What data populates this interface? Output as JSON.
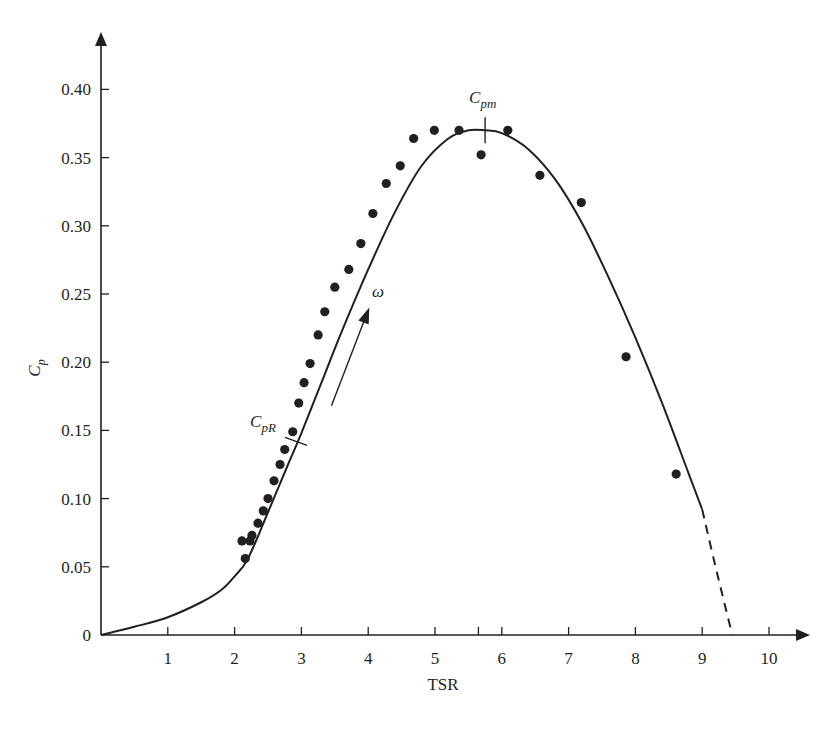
{
  "chart_data": {
    "type": "scatter",
    "title": "",
    "xlabel": "TSR",
    "ylabel": "C_p",
    "ylabel_main": "C",
    "ylabel_sub": "p",
    "xlim": [
      0,
      10.5
    ],
    "ylim": [
      0,
      0.42
    ],
    "grid": false,
    "legend": null,
    "x_ticks": [
      1,
      2,
      3,
      4,
      5,
      6,
      7,
      8,
      9,
      10
    ],
    "x_tick_labels": [
      "1",
      "2",
      "3",
      "4",
      "5",
      "6",
      "7",
      "8",
      "9",
      "10"
    ],
    "y_ticks": [
      0,
      0.05,
      0.1,
      0.15,
      0.2,
      0.25,
      0.3,
      0.35,
      0.4
    ],
    "y_tick_labels": [
      "0",
      "0.05",
      "0.10",
      "0.15",
      "0.20",
      "0.25",
      "0.30",
      "0.35",
      "0.40"
    ],
    "extra_x_tick": 5.65,
    "series": [
      {
        "name": "Measured data",
        "kind": "scatter",
        "x": [
          2.11,
          2.23,
          2.16,
          2.26,
          2.35,
          2.43,
          2.5,
          2.59,
          2.68,
          2.75,
          2.87,
          2.96,
          3.04,
          3.13,
          3.25,
          3.35,
          3.5,
          3.71,
          3.89,
          4.07,
          4.27,
          4.48,
          4.68,
          4.99,
          5.36,
          5.69,
          6.09,
          6.57,
          7.19,
          7.86,
          8.61
        ],
        "y": [
          0.069,
          0.069,
          0.056,
          0.073,
          0.082,
          0.091,
          0.1,
          0.113,
          0.125,
          0.136,
          0.149,
          0.17,
          0.185,
          0.199,
          0.22,
          0.237,
          0.255,
          0.268,
          0.287,
          0.309,
          0.331,
          0.344,
          0.364,
          0.37,
          0.37,
          0.352,
          0.37,
          0.337,
          0.317,
          0.204,
          0.118
        ]
      },
      {
        "name": "Cp curve",
        "kind": "line",
        "x": [
          0,
          0.5,
          1.0,
          1.5,
          1.8,
          2.0,
          2.2,
          2.5,
          2.8,
          3.0,
          3.3,
          3.6,
          4.0,
          4.4,
          4.8,
          5.2,
          5.5,
          5.75,
          6.0,
          6.4,
          6.8,
          7.2,
          7.6,
          8.0,
          8.4,
          8.8,
          9.0
        ],
        "y": [
          0,
          0.006,
          0.013,
          0.024,
          0.033,
          0.043,
          0.056,
          0.09,
          0.125,
          0.148,
          0.185,
          0.222,
          0.268,
          0.31,
          0.344,
          0.364,
          0.37,
          0.37,
          0.368,
          0.356,
          0.334,
          0.302,
          0.262,
          0.218,
          0.17,
          0.118,
          0.092
        ]
      },
      {
        "name": "Extrapolation",
        "kind": "dashed-line",
        "x": [
          9.0,
          9.2,
          9.45
        ],
        "y": [
          0.092,
          0.05,
          0.0
        ]
      }
    ],
    "annotations": [
      {
        "label": "C_pm",
        "main": "C",
        "sub": "pm",
        "x": 5.75,
        "y": 0.37,
        "marker": "vertical-tick",
        "description": "Maximum power coefficient"
      },
      {
        "label": "C_pR",
        "main": "C",
        "sub": "pR",
        "x": 2.92,
        "y": 0.142,
        "marker": "cross-tick",
        "description": "Rated power coefficient"
      },
      {
        "label": "ω",
        "x": 4.1,
        "y": 0.25,
        "marker": "arrow",
        "arrow_from": [
          3.45,
          0.168
        ],
        "arrow_to": [
          4.0,
          0.238
        ],
        "description": "Direction of increasing rotor speed"
      }
    ]
  },
  "axes": {
    "x_title": "TSR",
    "y_title_main": "C",
    "y_title_sub": "p",
    "omega_label": "ω"
  }
}
